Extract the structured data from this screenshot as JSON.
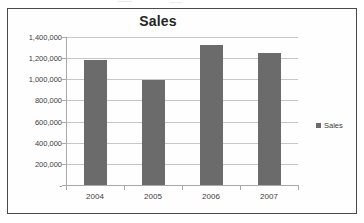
{
  "chart_data": {
    "type": "bar",
    "title": "Sales",
    "categories": [
      "2004",
      "2005",
      "2006",
      "2007"
    ],
    "values": [
      1180000,
      995000,
      1320000,
      1250000
    ],
    "series": [
      {
        "name": "Sales",
        "values": [
          1180000,
          995000,
          1320000,
          1250000
        ]
      }
    ],
    "xlabel": "",
    "ylabel": "",
    "ylim": [
      0,
      1400000
    ],
    "ytick_values": [
      0,
      200000,
      400000,
      600000,
      800000,
      1000000,
      1200000,
      1400000
    ],
    "ytick_labels": [
      "-",
      "200,000",
      "400,000",
      "600,000",
      "800,000",
      "1,000,000",
      "1,200,000",
      "1,400,000"
    ],
    "grid": true,
    "legend_position": "right",
    "legend_entries": [
      "Sales"
    ],
    "bar_color": "#6b6b6b",
    "gridline_color": "#c6c6c6",
    "axis_color": "#a9a9a9",
    "title_color": "#262626",
    "label_color": "#404040",
    "plot_background": "#fefefe",
    "frame_border_color": "#4a4a4a"
  }
}
